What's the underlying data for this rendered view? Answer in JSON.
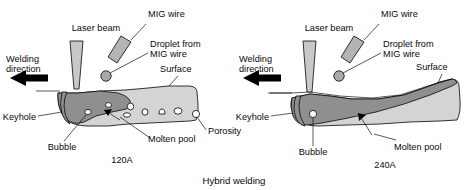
{
  "figure": {
    "caption": "Hybrid welding",
    "panels": [
      {
        "id": "panel-120a",
        "current_label": "120A",
        "labels": {
          "laser_beam": "Laser beam",
          "mig_wire": "MIG wire",
          "droplet": "Droplet from\nMIG wire",
          "droplet_line1": "Droplet from",
          "droplet_line2": "MIG wire",
          "welding_direction_line1": "Welding",
          "welding_direction_line2": "direction",
          "surface": "Surface",
          "keyhole": "Keyhole",
          "bubble": "Bubble",
          "molten_pool": "Molten pool",
          "porosity": "Porosity"
        },
        "porosity_count": 7,
        "has_porosity": true
      },
      {
        "id": "panel-240a",
        "current_label": "240A",
        "labels": {
          "laser_beam": "Laser beam",
          "mig_wire": "MIG wire",
          "droplet_line1": "Droplet from",
          "droplet_line2": "MIG wire",
          "welding_direction_line1": "Welding",
          "welding_direction_line2": "direction",
          "surface": "Surface",
          "keyhole": "Keyhole",
          "bubble": "Bubble",
          "molten_pool": "Molten pool"
        },
        "porosity_count": 0,
        "has_porosity": false
      }
    ]
  },
  "colors": {
    "background": "#ffffff",
    "plate_fill": "#d4d4d4",
    "molten_pool_fill": "#8f8f8f",
    "laser_beam_fill": "#c8c8c8",
    "mig_wire_fill": "#b4b4b4",
    "droplet_fill": "#a8a8a8",
    "bubble_fill": "#ffffff",
    "outline": "#111111",
    "arrow": "#000000",
    "text": "#0a0a0a"
  }
}
